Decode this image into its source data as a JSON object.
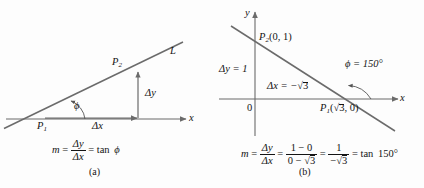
{
  "figure": {
    "background_color": "#fdfdfd",
    "line_color": "#6b6b6b",
    "axis_color": "#6b6b6b",
    "text_color": "#141414"
  },
  "panel_a": {
    "caption": "(a)",
    "line_label": "L",
    "point1": {
      "label": "P",
      "sub": "1"
    },
    "point2": {
      "label": "P",
      "sub": "2"
    },
    "axis_x_label": "x",
    "delta_y_label": "Δy",
    "delta_x_label": "Δx",
    "angle_label": "ϕ",
    "equation": {
      "m": "m",
      "eq1": "=",
      "numerator": "Δy",
      "denominator": "Δx",
      "eq2": "=",
      "tan": "tan",
      "angle": "ϕ"
    }
  },
  "panel_b": {
    "caption": "(b)",
    "axis_x_label": "x",
    "axis_y_label": "y",
    "origin_label": "0",
    "point2_label": "P",
    "point2_sub": "2",
    "point2_coords": "(0, 1)",
    "point1_label": "P",
    "point1_sub": "1",
    "point1_coords_open": "(",
    "point1_coords_radicand": "3",
    "point1_coords_close": ", 0)",
    "delta_y_label": "Δy = 1",
    "delta_x_label": "Δx = −",
    "delta_x_radicand": "3",
    "angle_label": "ϕ = 150°",
    "equation": {
      "m": "m",
      "eq1": "=",
      "frac1_num": "Δy",
      "frac1_den": "Δx",
      "eq2": "=",
      "frac2_num": "1 − 0",
      "frac2_den_a": "0 − ",
      "frac2_den_rad": "3",
      "eq3": "=",
      "frac3_num": "1",
      "frac3_den_a": "−",
      "frac3_den_rad": "3",
      "eq4": "=",
      "tan": "tan",
      "angle": "150°"
    }
  }
}
